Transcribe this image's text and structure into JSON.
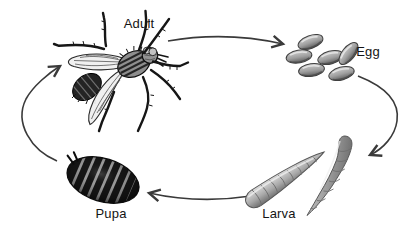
{
  "figure": {
    "type": "life-cycle-diagram",
    "background_color": "#ffffff",
    "labels": {
      "adult": "Adult",
      "egg": "Egg",
      "larva": "Larva",
      "pupa": "Pupa"
    },
    "stages": [
      {
        "id": "adult",
        "label": "Adult",
        "illustration": "housefly"
      },
      {
        "id": "egg",
        "label": "Egg",
        "illustration": "cluster-of-six-eggs"
      },
      {
        "id": "larva",
        "label": "Larva",
        "illustration": "two-segmented-maggots"
      },
      {
        "id": "pupa",
        "label": "Pupa",
        "illustration": "dark-striped-pupa-case"
      }
    ],
    "transitions": [
      {
        "from": "Adult",
        "to": "Egg"
      },
      {
        "from": "Egg",
        "to": "Larva"
      },
      {
        "from": "Larva",
        "to": "Pupa"
      },
      {
        "from": "Pupa",
        "to": "Adult"
      }
    ],
    "colors": {
      "ink": "#161616",
      "arrow": "#3a3a3a",
      "egg_light": "#d2d2d2",
      "egg_dark": "#595959",
      "larva_light": "#d8d8d8",
      "larva_dark": "#6f6f6f",
      "pupa_base": "#9a9a9a",
      "pupa_stripe": "#161616",
      "wing_fill": "#efefef"
    },
    "egg_count": 6,
    "larva_count": 2
  }
}
